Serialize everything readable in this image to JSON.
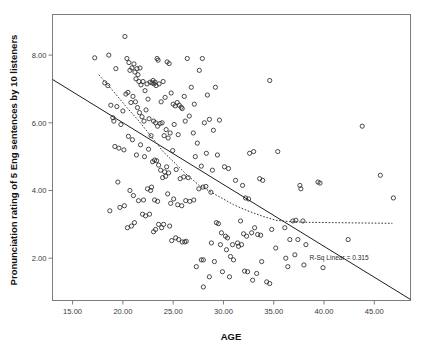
{
  "chart_data": {
    "type": "scatter",
    "title": "",
    "xlabel": "AGE",
    "ylabel": "Pronunciation rating of 5 Eng sentences by 10 listeners",
    "xlim": [
      13.0,
      48.6
    ],
    "ylim": [
      0.75,
      9.2
    ],
    "xticks": [
      15.0,
      20.0,
      25.0,
      30.0,
      35.0,
      40.0,
      45.0
    ],
    "xtick_labels": [
      "15.00",
      "20.00",
      "25.00",
      "30.00",
      "35.00",
      "40.00",
      "45.00"
    ],
    "yticks": [
      2.0,
      4.0,
      6.0,
      8.0
    ],
    "ytick_labels": [
      "2.00",
      "4.00",
      "6.00",
      "8.00"
    ],
    "grid": false,
    "legend": "none",
    "marker": "open-circle",
    "marker_color": "#2a2a2a",
    "annotations": [
      {
        "name": "r-squared-annotation",
        "text": "R-Sq Linear = 0.315",
        "x": 41.5,
        "y": 1.95
      }
    ],
    "series": [
      {
        "name": "Pronunciation rating vs age",
        "type": "scatter",
        "points": [
          [
            17.2,
            7.92
          ],
          [
            18.6,
            8.0
          ],
          [
            19.3,
            7.6
          ],
          [
            20.2,
            8.55
          ],
          [
            20.4,
            7.9
          ],
          [
            20.6,
            7.78
          ],
          [
            20.7,
            7.55
          ],
          [
            20.9,
            7.62
          ],
          [
            21.1,
            7.74
          ],
          [
            21.2,
            7.5
          ],
          [
            21.3,
            7.3
          ],
          [
            21.4,
            7.6
          ],
          [
            21.5,
            7.42
          ],
          [
            21.6,
            7.22
          ],
          [
            21.7,
            7.62
          ],
          [
            21.8,
            7.12
          ],
          [
            22.0,
            7.22
          ],
          [
            22.2,
            6.95
          ],
          [
            22.4,
            7.15
          ],
          [
            22.5,
            6.7
          ],
          [
            22.7,
            7.2
          ],
          [
            22.9,
            7.18
          ],
          [
            23.0,
            7.25
          ],
          [
            23.1,
            7.15
          ],
          [
            23.2,
            7.2
          ],
          [
            23.3,
            7.1
          ],
          [
            23.4,
            7.9
          ],
          [
            23.5,
            7.85
          ],
          [
            23.6,
            7.15
          ],
          [
            23.8,
            6.62
          ],
          [
            24.0,
            7.22
          ],
          [
            24.2,
            6.75
          ],
          [
            24.4,
            7.8
          ],
          [
            24.6,
            7.75
          ],
          [
            24.8,
            6.88
          ],
          [
            25.0,
            6.55
          ],
          [
            25.2,
            6.5
          ],
          [
            25.4,
            6.6
          ],
          [
            25.6,
            6.52
          ],
          [
            25.8,
            6.46
          ],
          [
            26.1,
            6.78
          ],
          [
            26.4,
            7.9
          ],
          [
            26.8,
            7.05
          ],
          [
            27.1,
            6.55
          ],
          [
            27.6,
            7.55
          ],
          [
            27.9,
            7.9
          ],
          [
            28.4,
            6.82
          ],
          [
            29.2,
            7.05
          ],
          [
            34.6,
            7.25
          ],
          [
            18.2,
            7.18
          ],
          [
            18.5,
            7.1
          ],
          [
            18.8,
            6.52
          ],
          [
            19.0,
            6.15
          ],
          [
            19.1,
            6.05
          ],
          [
            19.4,
            6.48
          ],
          [
            19.8,
            5.95
          ],
          [
            20.0,
            6.35
          ],
          [
            20.3,
            6.85
          ],
          [
            20.5,
            6.9
          ],
          [
            20.8,
            6.6
          ],
          [
            21.0,
            6.78
          ],
          [
            21.25,
            6.62
          ],
          [
            21.45,
            6.45
          ],
          [
            21.65,
            6.3
          ],
          [
            21.9,
            6.18
          ],
          [
            22.1,
            6.05
          ],
          [
            22.3,
            6.38
          ],
          [
            22.6,
            6.12
          ],
          [
            22.8,
            5.62
          ],
          [
            23.05,
            6.05
          ],
          [
            23.25,
            6.0
          ],
          [
            23.45,
            5.9
          ],
          [
            23.7,
            5.98
          ],
          [
            23.9,
            6.0
          ],
          [
            24.1,
            5.62
          ],
          [
            24.3,
            5.8
          ],
          [
            24.5,
            5.55
          ],
          [
            24.7,
            5.7
          ],
          [
            25.1,
            5.95
          ],
          [
            25.5,
            5.65
          ],
          [
            25.9,
            6.42
          ],
          [
            26.2,
            6.05
          ],
          [
            26.6,
            6.2
          ],
          [
            27.0,
            5.7
          ],
          [
            27.4,
            5.4
          ],
          [
            28.1,
            6.0
          ],
          [
            28.6,
            6.1
          ],
          [
            29.0,
            5.78
          ],
          [
            29.6,
            6.08
          ],
          [
            19.2,
            5.3
          ],
          [
            19.6,
            5.25
          ],
          [
            20.1,
            5.2
          ],
          [
            20.55,
            5.6
          ],
          [
            20.95,
            5.5
          ],
          [
            21.35,
            5.05
          ],
          [
            21.75,
            5.35
          ],
          [
            22.15,
            5.0
          ],
          [
            22.55,
            5.22
          ],
          [
            22.95,
            4.85
          ],
          [
            23.15,
            4.9
          ],
          [
            23.35,
            4.88
          ],
          [
            23.55,
            4.75
          ],
          [
            23.75,
            4.6
          ],
          [
            24.15,
            4.55
          ],
          [
            24.35,
            4.7
          ],
          [
            24.55,
            4.52
          ],
          [
            24.95,
            5.18
          ],
          [
            25.3,
            4.62
          ],
          [
            25.7,
            4.35
          ],
          [
            26.05,
            4.4
          ],
          [
            26.5,
            4.38
          ],
          [
            27.2,
            5.0
          ],
          [
            27.8,
            4.72
          ],
          [
            28.3,
            5.1
          ],
          [
            28.9,
            4.6
          ],
          [
            29.4,
            5.05
          ],
          [
            30.1,
            4.7
          ],
          [
            30.5,
            4.65
          ],
          [
            31.2,
            4.3
          ],
          [
            32.6,
            5.1
          ],
          [
            33.0,
            5.15
          ],
          [
            35.4,
            5.15
          ],
          [
            33.6,
            4.35
          ],
          [
            33.9,
            4.3
          ],
          [
            19.5,
            4.25
          ],
          [
            20.7,
            4.0
          ],
          [
            21.05,
            3.85
          ],
          [
            21.55,
            3.7
          ],
          [
            22.05,
            3.72
          ],
          [
            22.45,
            4.05
          ],
          [
            22.75,
            4.0
          ],
          [
            22.85,
            4.1
          ],
          [
            23.15,
            3.72
          ],
          [
            23.45,
            3.68
          ],
          [
            23.95,
            4.38
          ],
          [
            24.25,
            4.42
          ],
          [
            24.45,
            3.9
          ],
          [
            24.75,
            3.62
          ],
          [
            25.05,
            3.75
          ],
          [
            25.45,
            3.58
          ],
          [
            25.85,
            3.55
          ],
          [
            26.25,
            3.7
          ],
          [
            26.65,
            3.68
          ],
          [
            27.05,
            3.72
          ],
          [
            27.55,
            4.05
          ],
          [
            27.95,
            4.1
          ],
          [
            28.25,
            4.12
          ],
          [
            28.75,
            3.95
          ],
          [
            31.9,
            4.15
          ],
          [
            32.2,
            3.78
          ],
          [
            32.5,
            3.75
          ],
          [
            37.6,
            4.15
          ],
          [
            37.7,
            4.05
          ],
          [
            39.4,
            4.25
          ],
          [
            39.6,
            4.22
          ],
          [
            45.6,
            4.45
          ],
          [
            46.9,
            3.78
          ],
          [
            43.8,
            5.9
          ],
          [
            18.7,
            3.4
          ],
          [
            19.7,
            3.5
          ],
          [
            20.15,
            3.55
          ],
          [
            20.45,
            2.9
          ],
          [
            20.85,
            2.95
          ],
          [
            21.15,
            3.05
          ],
          [
            21.95,
            3.3
          ],
          [
            22.25,
            3.25
          ],
          [
            22.65,
            3.3
          ],
          [
            23.05,
            2.78
          ],
          [
            23.25,
            2.85
          ],
          [
            23.55,
            3.0
          ],
          [
            23.85,
            2.9
          ],
          [
            24.05,
            3.0
          ],
          [
            24.65,
            2.95
          ],
          [
            24.85,
            2.52
          ],
          [
            25.25,
            2.6
          ],
          [
            25.55,
            2.55
          ],
          [
            26.15,
            2.48
          ],
          [
            28.0,
            1.95
          ],
          [
            29.3,
            3.05
          ],
          [
            29.5,
            3.02
          ],
          [
            29.8,
            2.75
          ],
          [
            30.2,
            2.65
          ],
          [
            30.4,
            2.6
          ],
          [
            30.9,
            2.4
          ],
          [
            31.4,
            2.45
          ],
          [
            31.7,
            3.1
          ],
          [
            32.0,
            2.72
          ],
          [
            32.3,
            2.65
          ],
          [
            32.8,
            2.75
          ],
          [
            33.1,
            2.9
          ],
          [
            33.4,
            2.7
          ],
          [
            33.7,
            2.68
          ],
          [
            34.8,
            2.85
          ],
          [
            35.2,
            2.3
          ],
          [
            36.1,
            2.9
          ],
          [
            36.6,
            2.55
          ],
          [
            36.9,
            3.1
          ],
          [
            37.2,
            3.12
          ],
          [
            37.4,
            2.55
          ],
          [
            37.9,
            3.1
          ],
          [
            38.2,
            2.4
          ],
          [
            42.4,
            2.55
          ],
          [
            26.3,
            2.5
          ],
          [
            27.3,
            1.75
          ],
          [
            27.8,
            1.95
          ],
          [
            28.0,
            1.15
          ],
          [
            28.6,
            1.45
          ],
          [
            29.1,
            1.9
          ],
          [
            29.9,
            1.6
          ],
          [
            30.3,
            2.25
          ],
          [
            30.7,
            2.05
          ],
          [
            31.0,
            1.95
          ],
          [
            31.5,
            2.35
          ],
          [
            31.8,
            2.4
          ],
          [
            32.1,
            1.62
          ],
          [
            32.4,
            1.6
          ],
          [
            32.9,
            1.35
          ],
          [
            33.3,
            1.55
          ],
          [
            33.8,
            1.9
          ],
          [
            34.3,
            1.3
          ],
          [
            34.6,
            1.25
          ],
          [
            36.2,
            2.0
          ],
          [
            36.4,
            1.75
          ],
          [
            37.1,
            2.1
          ],
          [
            38.0,
            1.8
          ],
          [
            39.9,
            1.72
          ],
          [
            30.6,
            1.45
          ],
          [
            29.7,
            2.4
          ],
          [
            28.8,
            2.45
          ],
          [
            25.9,
            2.48
          ]
        ]
      }
    ],
    "fit_lines": [
      {
        "name": "linear-regression-line",
        "style": "solid",
        "x0": 13.0,
        "y0": 7.28,
        "x1": 48.6,
        "y1": 0.78
      },
      {
        "name": "loess-curve",
        "style": "dotted",
        "points": [
          [
            17.6,
            7.42
          ],
          [
            19.0,
            6.95
          ],
          [
            20.4,
            6.45
          ],
          [
            21.6,
            6.05
          ],
          [
            22.8,
            5.6
          ],
          [
            24.0,
            5.15
          ],
          [
            25.2,
            4.8
          ],
          [
            26.4,
            4.45
          ],
          [
            27.6,
            4.15
          ],
          [
            28.6,
            3.98
          ],
          [
            29.8,
            3.78
          ],
          [
            31.0,
            3.58
          ],
          [
            32.4,
            3.4
          ],
          [
            33.8,
            3.25
          ],
          [
            35.2,
            3.12
          ],
          [
            36.6,
            3.08
          ],
          [
            38.5,
            3.06
          ],
          [
            41.0,
            3.05
          ],
          [
            44.0,
            3.04
          ],
          [
            46.8,
            3.03
          ]
        ]
      }
    ]
  }
}
